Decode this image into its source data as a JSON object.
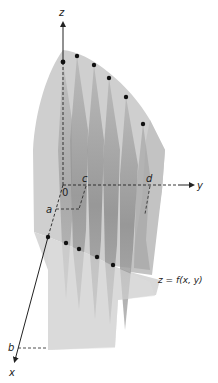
{
  "figure": {
    "type": "3d-surface-slices",
    "equation_label": "z = f(x, y)",
    "axes": {
      "x": {
        "label": "x"
      },
      "y": {
        "label": "y"
      },
      "z": {
        "label": "z"
      }
    },
    "origin_label": "0",
    "bounds": {
      "a": "a",
      "b": "b",
      "c": "c",
      "d": "d"
    },
    "slice_count": 5,
    "top_edge_points": 6,
    "bottom_edge_points": 5,
    "colors": {
      "surface_light": "#d4d4d4",
      "surface_mid": "#bdbdbd",
      "slice_dark": "#8f8f8f",
      "axis": "#222222",
      "dot": "#111111"
    }
  }
}
